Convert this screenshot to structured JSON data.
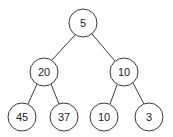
{
  "diagram": {
    "type": "binary-tree",
    "nodes": [
      {
        "id": "n0",
        "label": "5",
        "x": 83,
        "y": 23
      },
      {
        "id": "n1",
        "label": "20",
        "x": 44,
        "y": 72
      },
      {
        "id": "n2",
        "label": "10",
        "x": 124,
        "y": 72
      },
      {
        "id": "n3",
        "label": "45",
        "x": 22,
        "y": 117
      },
      {
        "id": "n4",
        "label": "37",
        "x": 64,
        "y": 117
      },
      {
        "id": "n5",
        "label": "10",
        "x": 104,
        "y": 117
      },
      {
        "id": "n6",
        "label": "3",
        "x": 149,
        "y": 117
      }
    ],
    "edges": [
      [
        "n0",
        "n1"
      ],
      [
        "n0",
        "n2"
      ],
      [
        "n1",
        "n3"
      ],
      [
        "n1",
        "n4"
      ],
      [
        "n2",
        "n5"
      ],
      [
        "n2",
        "n6"
      ]
    ],
    "node_radius": 14
  }
}
